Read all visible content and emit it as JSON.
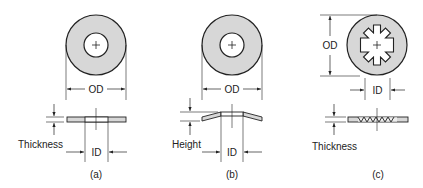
{
  "colors": {
    "fill": "#d7d7d7",
    "stroke": "#222222",
    "background": "#ffffff"
  },
  "panels": [
    {
      "id": "a",
      "caption": "(a)",
      "od_label": "OD",
      "id_label": "ID",
      "side_label": "Thickness",
      "type": "flat-washer"
    },
    {
      "id": "b",
      "caption": "(b)",
      "od_label": "OD",
      "id_label": "ID",
      "side_label": "Height",
      "type": "curved-spring-washer"
    },
    {
      "id": "c",
      "caption": "(c)",
      "od_label": "OD",
      "id_label": "ID",
      "side_label": "Thickness",
      "type": "internal-tooth-lock-washer"
    }
  ]
}
